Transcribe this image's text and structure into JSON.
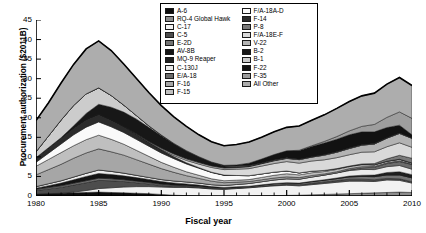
{
  "chart_data": {
    "type": "area",
    "title": "",
    "xlabel": "Fiscal year",
    "ylabel": "Procurement authorization ($2011B)",
    "xlim": [
      1980,
      2010
    ],
    "ylim": [
      0,
      45
    ],
    "ytick_labels": [
      "0",
      "5",
      "10",
      "15",
      "20",
      "25",
      "30",
      "35",
      "40",
      "45"
    ],
    "ytick_values": [
      0,
      5,
      10,
      15,
      20,
      25,
      30,
      35,
      40,
      45
    ],
    "xtick_labels": [
      "1980",
      "1985",
      "1990",
      "1995",
      "2000",
      "2005",
      "2010"
    ],
    "xtick_values": [
      1980,
      1985,
      1990,
      1995,
      2000,
      2005,
      2010
    ],
    "minor_xticks": true,
    "grid": false,
    "legend_position": "top-center",
    "stacked": true,
    "x": [
      1980,
      1981,
      1982,
      1983,
      1984,
      1985,
      1986,
      1987,
      1988,
      1989,
      1990,
      1991,
      1992,
      1993,
      1994,
      1995,
      1996,
      1997,
      1998,
      1999,
      2000,
      2001,
      2002,
      2003,
      2004,
      2005,
      2006,
      2007,
      2008,
      2009,
      2010
    ],
    "series": [
      {
        "name": "A-6",
        "color": "#0d0d0d",
        "values": [
          0.5,
          0.6,
          0.7,
          0.8,
          0.9,
          1.0,
          0.9,
          0.8,
          0.7,
          0.6,
          0.4,
          0.2,
          0.1,
          0.05,
          0,
          0,
          0,
          0,
          0,
          0,
          0,
          0,
          0,
          0,
          0,
          0,
          0,
          0,
          0,
          0,
          0
        ]
      },
      {
        "name": "RQ-4 Global Hawk",
        "color": "#8c8c8c",
        "values": [
          0,
          0,
          0,
          0,
          0,
          0,
          0,
          0,
          0,
          0,
          0,
          0,
          0,
          0,
          0,
          0,
          0,
          0,
          0.05,
          0.1,
          0.15,
          0.2,
          0.3,
          0.4,
          0.5,
          0.6,
          0.7,
          0.8,
          0.9,
          1.0,
          0.9
        ]
      },
      {
        "name": "C-17",
        "color": "#f2f2f2",
        "values": [
          0,
          0,
          0,
          0.2,
          0.5,
          0.9,
          1.2,
          1.5,
          1.7,
          1.8,
          1.9,
          2.0,
          2.1,
          2.0,
          1.8,
          1.7,
          1.9,
          2.1,
          2.3,
          2.5,
          2.6,
          2.4,
          2.6,
          2.8,
          3.0,
          3.2,
          3.1,
          2.9,
          3.2,
          3.0,
          2.4
        ]
      },
      {
        "name": "C-5",
        "color": "#4d4d4d",
        "values": [
          0.9,
          1.2,
          1.5,
          1.8,
          2.0,
          2.1,
          1.8,
          1.4,
          1.0,
          0.7,
          0.4,
          0.3,
          0.2,
          0.15,
          0.1,
          0.1,
          0.1,
          0.1,
          0.15,
          0.2,
          0.25,
          0.3,
          0.35,
          0.4,
          0.45,
          0.5,
          0.5,
          0.45,
          0.4,
          0.4,
          0.35
        ]
      },
      {
        "name": "E-2D",
        "color": "#737373",
        "values": [
          0.3,
          0.35,
          0.4,
          0.45,
          0.5,
          0.55,
          0.5,
          0.45,
          0.4,
          0.35,
          0.3,
          0.25,
          0.2,
          0.2,
          0.2,
          0.2,
          0.2,
          0.2,
          0.25,
          0.3,
          0.3,
          0.35,
          0.4,
          0.45,
          0.5,
          0.6,
          0.7,
          0.8,
          0.9,
          1.0,
          1.0
        ]
      },
      {
        "name": "AV-8B",
        "color": "#141414",
        "values": [
          0.3,
          0.5,
          0.7,
          0.9,
          1.1,
          1.2,
          1.1,
          1.0,
          0.9,
          0.8,
          0.7,
          0.6,
          0.5,
          0.4,
          0.3,
          0.2,
          0.15,
          0.1,
          0.1,
          0.1,
          0.1,
          0.05,
          0.05,
          0,
          0,
          0,
          0,
          0,
          0,
          0,
          0
        ]
      },
      {
        "name": "MQ-9 Reaper",
        "color": "#1f1f1f",
        "values": [
          0,
          0,
          0,
          0,
          0,
          0,
          0,
          0,
          0,
          0,
          0,
          0,
          0,
          0,
          0,
          0,
          0,
          0,
          0,
          0,
          0,
          0,
          0.05,
          0.1,
          0.15,
          0.2,
          0.3,
          0.4,
          0.6,
          0.8,
          0.8
        ]
      },
      {
        "name": "C-130J",
        "color": "#ebebeb",
        "values": [
          0.4,
          0.5,
          0.6,
          0.7,
          0.8,
          0.9,
          0.8,
          0.7,
          0.6,
          0.5,
          0.5,
          0.5,
          0.5,
          0.5,
          0.5,
          0.5,
          0.6,
          0.7,
          0.8,
          0.9,
          1.0,
          1.0,
          1.1,
          1.2,
          1.3,
          1.4,
          1.5,
          1.4,
          1.5,
          1.6,
          1.4
        ]
      },
      {
        "name": "E/A-18",
        "color": "#6b6b6b",
        "values": [
          0,
          0,
          0,
          0,
          0,
          0,
          0,
          0,
          0,
          0,
          0,
          0,
          0,
          0,
          0,
          0,
          0,
          0,
          0,
          0,
          0,
          0,
          0,
          0,
          0,
          0.2,
          0.4,
          0.6,
          0.8,
          1.0,
          1.2
        ]
      },
      {
        "name": "F-16",
        "color": "#a6a6a6",
        "values": [
          3.0,
          3.6,
          4.2,
          4.8,
          5.2,
          5.4,
          5.0,
          4.6,
          4.0,
          3.4,
          2.8,
          2.2,
          1.6,
          1.2,
          0.9,
          0.7,
          0.6,
          0.5,
          0.5,
          0.5,
          0.5,
          0.4,
          0.4,
          0.3,
          0.3,
          0.3,
          0.3,
          0.2,
          0.2,
          0.2,
          0.1
        ]
      },
      {
        "name": "F-15",
        "color": "#bfbfbf",
        "values": [
          2.2,
          2.6,
          3.0,
          3.2,
          3.4,
          3.5,
          3.2,
          2.8,
          2.4,
          2.0,
          1.6,
          1.3,
          1.0,
          0.8,
          0.6,
          0.5,
          0.5,
          0.5,
          0.6,
          0.7,
          0.8,
          0.7,
          0.7,
          0.6,
          0.6,
          0.5,
          0.5,
          0.4,
          0.4,
          0.4,
          0.3
        ]
      },
      {
        "name": "F/A-18A-D",
        "color": "#fafafa",
        "values": [
          1.0,
          1.6,
          2.2,
          2.8,
          3.2,
          3.4,
          3.2,
          3.0,
          2.8,
          2.6,
          2.4,
          2.2,
          2.0,
          1.8,
          1.6,
          1.4,
          1.2,
          1.0,
          0.9,
          0.8,
          0.7,
          0.5,
          0.4,
          0.3,
          0.2,
          0.15,
          0.1,
          0.05,
          0,
          0,
          0
        ]
      },
      {
        "name": "F-14",
        "color": "#2b2b2b",
        "values": [
          1.2,
          1.4,
          1.6,
          1.8,
          2.0,
          2.0,
          1.8,
          1.6,
          1.3,
          1.0,
          0.8,
          0.5,
          0.3,
          0.15,
          0.1,
          0.05,
          0,
          0,
          0,
          0,
          0,
          0,
          0,
          0,
          0,
          0,
          0,
          0,
          0,
          0,
          0
        ]
      },
      {
        "name": "P-8",
        "color": "#7a7a7a",
        "values": [
          0,
          0,
          0,
          0,
          0,
          0,
          0,
          0,
          0,
          0,
          0,
          0,
          0,
          0,
          0,
          0,
          0,
          0,
          0,
          0,
          0,
          0,
          0,
          0,
          0,
          0,
          0.1,
          0.3,
          0.6,
          1.0,
          1.2
        ]
      },
      {
        "name": "F/A-18E-F",
        "color": "#d9d9d9",
        "values": [
          0,
          0,
          0,
          0,
          0,
          0,
          0,
          0,
          0,
          0,
          0.1,
          0.3,
          0.6,
          0.9,
          1.2,
          1.4,
          1.6,
          1.8,
          2.0,
          2.2,
          2.4,
          2.5,
          2.6,
          2.7,
          2.8,
          2.9,
          3.0,
          3.0,
          3.1,
          3.2,
          2.8
        ]
      },
      {
        "name": "V-22",
        "color": "#b3b3b3",
        "values": [
          0,
          0,
          0,
          0,
          0,
          0,
          0,
          0,
          0.1,
          0.2,
          0.3,
          0.4,
          0.4,
          0.4,
          0.4,
          0.4,
          0.4,
          0.5,
          0.6,
          0.7,
          0.8,
          0.9,
          1.0,
          1.2,
          1.4,
          1.6,
          1.8,
          2.0,
          2.2,
          2.4,
          2.3
        ]
      },
      {
        "name": "B-2",
        "color": "#171717",
        "values": [
          0,
          0,
          0,
          0.5,
          1.5,
          2.5,
          3.2,
          3.6,
          3.8,
          3.6,
          3.2,
          2.6,
          2.0,
          1.4,
          0.9,
          0.5,
          0.3,
          0.2,
          0.1,
          0.1,
          0.05,
          0,
          0,
          0,
          0,
          0,
          0,
          0,
          0,
          0,
          0
        ]
      },
      {
        "name": "B-1",
        "color": "#cccccc",
        "values": [
          1.5,
          3.0,
          4.5,
          5.2,
          5.0,
          4.2,
          3.0,
          1.8,
          0.9,
          0.4,
          0.2,
          0.1,
          0.1,
          0.1,
          0.1,
          0.1,
          0.1,
          0.1,
          0.1,
          0.1,
          0.1,
          0.1,
          0.1,
          0.1,
          0.1,
          0.1,
          0.1,
          0.1,
          0.1,
          0.1,
          0.1
        ]
      },
      {
        "name": "F-22",
        "color": "#121212",
        "values": [
          0,
          0,
          0,
          0,
          0,
          0,
          0,
          0,
          0,
          0,
          0,
          0,
          0,
          0,
          0,
          0.1,
          0.3,
          0.6,
          1.0,
          1.4,
          1.8,
          2.2,
          2.6,
          3.0,
          3.2,
          3.4,
          3.3,
          3.0,
          2.6,
          2.0,
          0.8
        ]
      },
      {
        "name": "F-35",
        "color": "#9e9e9e",
        "values": [
          0,
          0,
          0,
          0,
          0,
          0,
          0,
          0,
          0,
          0,
          0,
          0,
          0,
          0,
          0,
          0,
          0,
          0,
          0,
          0,
          0,
          0.1,
          0.2,
          0.4,
          0.7,
          1.0,
          1.4,
          1.9,
          2.6,
          3.4,
          4.2
        ]
      },
      {
        "name": "All Other",
        "color": "#adadad",
        "values": [
          8.0,
          8.5,
          9.5,
          10.5,
          11.5,
          12.0,
          11.5,
          10.5,
          9.5,
          8.5,
          7.5,
          6.8,
          6.2,
          5.6,
          5.2,
          5.0,
          5.2,
          5.4,
          5.6,
          5.8,
          6.0,
          6.2,
          6.5,
          6.8,
          7.2,
          7.5,
          7.8,
          8.0,
          8.5,
          8.8,
          8.4
        ]
      }
    ]
  },
  "legend": {
    "col1": [
      {
        "label": "A-6",
        "color": "#0d0d0d"
      },
      {
        "label": "RQ-4 Global Hawk",
        "color": "#8c8c8c"
      },
      {
        "label": "C-17",
        "color": "#f2f2f2"
      },
      {
        "label": "C-5",
        "color": "#4d4d4d"
      },
      {
        "label": "E-2D",
        "color": "#737373"
      },
      {
        "label": "AV-8B",
        "color": "#141414"
      },
      {
        "label": "MQ-9 Reaper",
        "color": "#1f1f1f"
      },
      {
        "label": "C-130J",
        "color": "#ebebeb"
      },
      {
        "label": "E/A-18",
        "color": "#6b6b6b"
      },
      {
        "label": "F-16",
        "color": "#a6a6a6"
      },
      {
        "label": "F-15",
        "color": "#bfbfbf"
      }
    ],
    "col2": [
      {
        "label": "F/A-18A-D",
        "color": "#fafafa"
      },
      {
        "label": "F-14",
        "color": "#2b2b2b"
      },
      {
        "label": "P-8",
        "color": "#7a7a7a"
      },
      {
        "label": "F/A-18E-F",
        "color": "#d9d9d9"
      },
      {
        "label": "V-22",
        "color": "#b3b3b3"
      },
      {
        "label": "B-2",
        "color": "#171717"
      },
      {
        "label": "B-1",
        "color": "#cccccc"
      },
      {
        "label": "F-22",
        "color": "#121212"
      },
      {
        "label": "F-35",
        "color": "#9e9e9e"
      },
      {
        "label": "All Other",
        "color": "#adadad"
      }
    ]
  }
}
